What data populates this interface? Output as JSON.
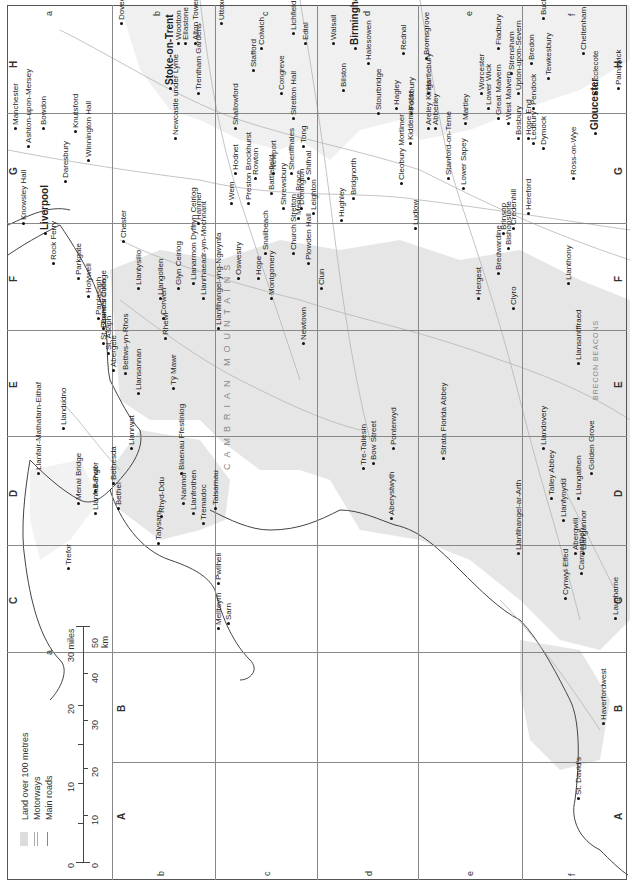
{
  "map": {
    "title": "Wales and the West Midlands",
    "orientation": "rotated 90 degrees counter-clockwise",
    "colors": {
      "land_over_100m": "#e4e4e4",
      "sea": "#ffffff",
      "roads": "#aaaaaa",
      "coast": "#444444",
      "grid": "#888888"
    },
    "grid": {
      "columns": [
        "A",
        "B",
        "C",
        "D",
        "E",
        "F",
        "G",
        "H"
      ],
      "rows": [
        "a",
        "b",
        "c",
        "d",
        "e",
        "f"
      ]
    },
    "legend": {
      "items": [
        {
          "label": "Land over 100 metres",
          "icon": "grey-swatch"
        },
        {
          "label": "Motorways",
          "icon": "double-line"
        },
        {
          "label": "Main roads",
          "icon": "single-line"
        }
      ],
      "scale": {
        "miles_label": "30 miles",
        "miles_ticks": [
          "0",
          "10",
          "20",
          "30 miles"
        ],
        "km_label": "50 km",
        "km_ticks": [
          "0",
          "10",
          "20",
          "30",
          "40",
          "50 km"
        ]
      }
    },
    "regions": [
      {
        "label": "CAMBRIAN MOUNTAINS"
      },
      {
        "label": "BRECON BEACONS"
      }
    ],
    "places": [
      {
        "name": "Manchester",
        "x": 12,
        "y": 130
      },
      {
        "name": "Ashton-upon-Mersey",
        "x": 25,
        "y": 148
      },
      {
        "name": "Bowdon",
        "x": 40,
        "y": 130
      },
      {
        "name": "Knutsford",
        "x": 72,
        "y": 133
      },
      {
        "name": "Daresbury",
        "x": 62,
        "y": 183
      },
      {
        "name": "Winnington Hall",
        "x": 85,
        "y": 162
      },
      {
        "name": "Stoke-on-Trent",
        "x": 165,
        "y": 90
      },
      {
        "name": "Newcastle under Lyme",
        "x": 172,
        "y": 140
      },
      {
        "name": "Trentham Gardens",
        "x": 195,
        "y": 95
      },
      {
        "name": "Wootton",
        "x": 175,
        "y": 45
      },
      {
        "name": "Ellastone",
        "x": 182,
        "y": 45
      },
      {
        "name": "Alton Towers",
        "x": 192,
        "y": 45
      },
      {
        "name": "Dovedale",
        "x": 118,
        "y": 25
      },
      {
        "name": "Uttoxeter",
        "x": 218,
        "y": 25
      },
      {
        "name": "Colwich",
        "x": 258,
        "y": 50
      },
      {
        "name": "Lichfield",
        "x": 290,
        "y": 35
      },
      {
        "name": "Edial",
        "x": 302,
        "y": 45
      },
      {
        "name": "Stafford",
        "x": 250,
        "y": 72
      },
      {
        "name": "Shallowford",
        "x": 232,
        "y": 130
      },
      {
        "name": "Congreve",
        "x": 278,
        "y": 95
      },
      {
        "name": "Stretton Hall",
        "x": 290,
        "y": 120
      },
      {
        "name": "Walsall",
        "x": 330,
        "y": 45
      },
      {
        "name": "Birmingham",
        "x": 350,
        "y": 50
      },
      {
        "name": "Bilston",
        "x": 340,
        "y": 92
      },
      {
        "name": "Halesowen",
        "x": 365,
        "y": 65
      },
      {
        "name": "Rednal",
        "x": 400,
        "y": 55
      },
      {
        "name": "Stourbridge",
        "x": 375,
        "y": 115
      },
      {
        "name": "Hagley",
        "x": 393,
        "y": 110
      },
      {
        "name": "Fockbury",
        "x": 408,
        "y": 115
      },
      {
        "name": "Bromsgrove",
        "x": 423,
        "y": 60
      },
      {
        "name": "Kidderminster",
        "x": 407,
        "y": 145
      },
      {
        "name": "Tong",
        "x": 300,
        "y": 148
      },
      {
        "name": "Newport",
        "x": 270,
        "y": 175
      },
      {
        "name": "Sheriffhales",
        "x": 288,
        "y": 175
      },
      {
        "name": "Shifnal",
        "x": 305,
        "y": 180
      },
      {
        "name": "Bridgnorth",
        "x": 350,
        "y": 200
      },
      {
        "name": "Cleobury Mortimer",
        "x": 398,
        "y": 185
      },
      {
        "name": "Hodnet",
        "x": 232,
        "y": 175
      },
      {
        "name": "Rowton",
        "x": 252,
        "y": 180
      },
      {
        "name": "Battlefield",
        "x": 268,
        "y": 195
      },
      {
        "name": "Shrewsbury",
        "x": 280,
        "y": 210
      },
      {
        "name": "Donington",
        "x": 298,
        "y": 210
      },
      {
        "name": "Leighton",
        "x": 310,
        "y": 215
      },
      {
        "name": "Hughley",
        "x": 338,
        "y": 222
      },
      {
        "name": "Ludlow",
        "x": 412,
        "y": 230
      },
      {
        "name": "Wem",
        "x": 228,
        "y": 205
      },
      {
        "name": "Preston Brockhurst",
        "x": 245,
        "y": 205
      },
      {
        "name": "Meole Brace",
        "x": 295,
        "y": 220
      },
      {
        "name": "Hanmer",
        "x": 195,
        "y": 225
      },
      {
        "name": "Oswestry",
        "x": 235,
        "y": 280
      },
      {
        "name": "Knowsley Hall",
        "x": 20,
        "y": 225
      },
      {
        "name": "Liverpool",
        "x": 40,
        "y": 235
      },
      {
        "name": "Rock Ferry",
        "x": 50,
        "y": 265
      },
      {
        "name": "Parkgate",
        "x": 75,
        "y": 280
      },
      {
        "name": "Holywell",
        "x": 85,
        "y": 298
      },
      {
        "name": "Chester",
        "x": 120,
        "y": 243
      },
      {
        "name": "Pantasaph",
        "x": 95,
        "y": 320
      },
      {
        "name": "Tremeirchion",
        "x": 100,
        "y": 330
      },
      {
        "name": "St. Beuno's College",
        "x": 100,
        "y": 345
      },
      {
        "name": "St. Asaph",
        "x": 105,
        "y": 355
      },
      {
        "name": "Abergele",
        "x": 110,
        "y": 372
      },
      {
        "name": "Bettws-yn-Rhos",
        "x": 122,
        "y": 375
      },
      {
        "name": "Llansannan",
        "x": 135,
        "y": 395
      },
      {
        "name": "Rhewl",
        "x": 162,
        "y": 340
      },
      {
        "name": "Llantysilio",
        "x": 135,
        "y": 290
      },
      {
        "name": "Llangollen",
        "x": 157,
        "y": 300
      },
      {
        "name": "Glyn Ceiriog",
        "x": 175,
        "y": 290
      },
      {
        "name": "Corwen",
        "x": 160,
        "y": 320
      },
      {
        "name": "Tŷ Mawr",
        "x": 170,
        "y": 390
      },
      {
        "name": "Llanarmon Dyffryn Ceiriog",
        "x": 190,
        "y": 285
      },
      {
        "name": "Llanrhaeadr-ym-Mochnant",
        "x": 200,
        "y": 300
      },
      {
        "name": "Llanfihangel-yng-Ngwynfa",
        "x": 215,
        "y": 330
      },
      {
        "name": "Hope",
        "x": 255,
        "y": 280
      },
      {
        "name": "Snailbeach",
        "x": 262,
        "y": 255
      },
      {
        "name": "Montgomery",
        "x": 268,
        "y": 300
      },
      {
        "name": "Church Stretton",
        "x": 290,
        "y": 255
      },
      {
        "name": "Plowden Hall",
        "x": 305,
        "y": 265
      },
      {
        "name": "Clun",
        "x": 318,
        "y": 290
      },
      {
        "name": "Newtown",
        "x": 300,
        "y": 345
      },
      {
        "name": "Llandudno",
        "x": 60,
        "y": 430
      },
      {
        "name": "Llanfair-Mathafarn-Eithaf",
        "x": 35,
        "y": 475
      },
      {
        "name": "Llanrwst",
        "x": 128,
        "y": 450
      },
      {
        "name": "Bangor",
        "x": 92,
        "y": 493
      },
      {
        "name": "Bethesda",
        "x": 110,
        "y": 485
      },
      {
        "name": "Bethel",
        "x": 115,
        "y": 510
      },
      {
        "name": "Menai Bridge",
        "x": 75,
        "y": 505
      },
      {
        "name": "Llanfair-Pwll",
        "x": 92,
        "y": 515
      },
      {
        "name": "Trefor",
        "x": 65,
        "y": 570
      },
      {
        "name": "Blaenau Ffestiniog",
        "x": 178,
        "y": 475
      },
      {
        "name": "Rhyd-Ddu",
        "x": 158,
        "y": 518
      },
      {
        "name": "Nanmor",
        "x": 180,
        "y": 505
      },
      {
        "name": "Llanfrothen",
        "x": 190,
        "y": 515
      },
      {
        "name": "Tremadoc",
        "x": 200,
        "y": 525
      },
      {
        "name": "Talysarn",
        "x": 155,
        "y": 545
      },
      {
        "name": "Talsarnau",
        "x": 212,
        "y": 510
      },
      {
        "name": "Pwllheli",
        "x": 215,
        "y": 585
      },
      {
        "name": "Mellteyrn",
        "x": 215,
        "y": 630
      },
      {
        "name": "Sarn",
        "x": 225,
        "y": 625
      },
      {
        "name": "Tre-Taliesin",
        "x": 360,
        "y": 470
      },
      {
        "name": "Bow Street",
        "x": 370,
        "y": 465
      },
      {
        "name": "Ponterwyd",
        "x": 390,
        "y": 450
      },
      {
        "name": "Aberystwyth",
        "x": 388,
        "y": 520
      },
      {
        "name": "Strata Florida Abbey",
        "x": 440,
        "y": 460
      },
      {
        "name": "Llandovery",
        "x": 540,
        "y": 450
      },
      {
        "name": "Llanfihangel-ar-Arth",
        "x": 515,
        "y": 555
      },
      {
        "name": "Talley Abbey",
        "x": 548,
        "y": 500
      },
      {
        "name": "Llanfynydd",
        "x": 560,
        "y": 522
      },
      {
        "name": "Llangathen",
        "x": 575,
        "y": 500
      },
      {
        "name": "Golden Grove",
        "x": 588,
        "y": 475
      },
      {
        "name": "Abergwili",
        "x": 572,
        "y": 555
      },
      {
        "name": "Llangunnor",
        "x": 580,
        "y": 555
      },
      {
        "name": "Carmarthen",
        "x": 578,
        "y": 575
      },
      {
        "name": "Cynwyl Elfed",
        "x": 562,
        "y": 600
      },
      {
        "name": "Laugharne",
        "x": 612,
        "y": 620
      },
      {
        "name": "Haverfordwest",
        "x": 600,
        "y": 725
      },
      {
        "name": "St. David's",
        "x": 575,
        "y": 800
      },
      {
        "name": "Llansantffraed",
        "x": 575,
        "y": 365
      },
      {
        "name": "Llanthony",
        "x": 565,
        "y": 285
      },
      {
        "name": "Hergest",
        "x": 475,
        "y": 300
      },
      {
        "name": "Bredwardine",
        "x": 495,
        "y": 275
      },
      {
        "name": "Brinsop",
        "x": 500,
        "y": 235
      },
      {
        "name": "Credenhill",
        "x": 510,
        "y": 230
      },
      {
        "name": "Bishopstone",
        "x": 505,
        "y": 250
      },
      {
        "name": "Clyro",
        "x": 510,
        "y": 310
      },
      {
        "name": "Hereford",
        "x": 525,
        "y": 215
      },
      {
        "name": "Stanford-on-Teme",
        "x": 445,
        "y": 180
      },
      {
        "name": "Lower Sapey",
        "x": 460,
        "y": 190
      },
      {
        "name": "Areley Kings",
        "x": 425,
        "y": 130
      },
      {
        "name": "Abberley",
        "x": 432,
        "y": 130
      },
      {
        "name": "Martley",
        "x": 462,
        "y": 125
      },
      {
        "name": "Worcester",
        "x": 478,
        "y": 95
      },
      {
        "name": "Lower Wick",
        "x": 485,
        "y": 110
      },
      {
        "name": "Hartlebury",
        "x": 425,
        "y": 95
      },
      {
        "name": "Great Malvern",
        "x": 495,
        "y": 120
      },
      {
        "name": "West Malvern",
        "x": 505,
        "y": 125
      },
      {
        "name": "Bosbury",
        "x": 515,
        "y": 140
      },
      {
        "name": "Hope End",
        "x": 525,
        "y": 140
      },
      {
        "name": "Upton-upon-Severn",
        "x": 515,
        "y": 95
      },
      {
        "name": "Ledbury",
        "x": 530,
        "y": 145
      },
      {
        "name": "Pendock",
        "x": 530,
        "y": 110
      },
      {
        "name": "Dymock",
        "x": 540,
        "y": 150
      },
      {
        "name": "Ross-on-Wye",
        "x": 570,
        "y": 180
      },
      {
        "name": "Gloucester",
        "x": 590,
        "y": 135
      },
      {
        "name": "Hucclecote",
        "x": 592,
        "y": 95
      },
      {
        "name": "Painswick",
        "x": 615,
        "y": 90
      },
      {
        "name": "Cheltenham",
        "x": 580,
        "y": 55
      },
      {
        "name": "Tewkesbury",
        "x": 545,
        "y": 80
      },
      {
        "name": "Bredon",
        "x": 528,
        "y": 65
      },
      {
        "name": "Strensham",
        "x": 508,
        "y": 75
      },
      {
        "name": "Fladbury",
        "x": 495,
        "y": 50
      },
      {
        "name": "Buckland",
        "x": 540,
        "y": 20
      }
    ]
  }
}
